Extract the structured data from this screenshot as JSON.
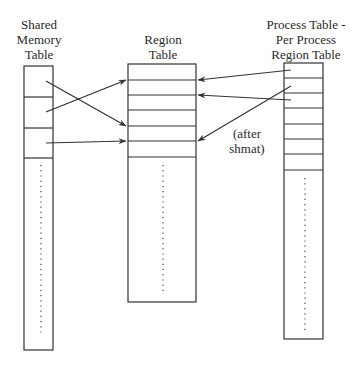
{
  "diagram": {
    "tables": [
      {
        "id": "shared-memory-table",
        "title_lines": [
          "Shared",
          "Memory",
          "Table"
        ],
        "box": {
          "x": 24,
          "y": 66,
          "w": 29,
          "h": 284
        },
        "row_lines": [
          97,
          128,
          158
        ],
        "dots": {
          "x": 41,
          "y1": 165,
          "y2": 335
        }
      },
      {
        "id": "region-table",
        "title_lines": [
          "Region",
          "Table"
        ],
        "box": {
          "x": 128,
          "y": 64,
          "w": 68,
          "h": 238
        },
        "row_lines": [
          80,
          95,
          110,
          126,
          141,
          157
        ],
        "dots": {
          "x": 163,
          "y1": 165,
          "y2": 293
        }
      },
      {
        "id": "process-table",
        "title_lines": [
          "Process Table -",
          "Per Process",
          "Region Table"
        ],
        "box": {
          "x": 284,
          "y": 63,
          "w": 39,
          "h": 276
        },
        "row_lines": [
          78,
          93,
          108,
          124,
          139,
          154,
          170
        ],
        "dots": {
          "x": 305,
          "y1": 178,
          "y2": 330
        }
      }
    ],
    "arrows": [
      {
        "from": "shared-memory-table",
        "to": "region-table",
        "x1": 46,
        "y1": 81,
        "x2": 126,
        "y2": 126
      },
      {
        "from": "shared-memory-table",
        "to": "region-table",
        "x1": 46,
        "y1": 112,
        "x2": 126,
        "y2": 80
      },
      {
        "from": "shared-memory-table",
        "to": "region-table",
        "x1": 46,
        "y1": 143,
        "x2": 126,
        "y2": 141
      },
      {
        "from": "process-table",
        "to": "region-table",
        "x1": 291,
        "y1": 70,
        "x2": 198,
        "y2": 80
      },
      {
        "from": "process-table",
        "to": "region-table",
        "x1": 291,
        "y1": 100,
        "x2": 198,
        "y2": 95
      },
      {
        "from": "process-table",
        "to": "region-table",
        "x1": 291,
        "y1": 86,
        "x2": 198,
        "y2": 141
      }
    ],
    "annotation": {
      "lines": [
        "(after",
        "shmat)"
      ],
      "x": 222,
      "y": 125
    },
    "colors": {
      "line": "#333333",
      "background": "#ffffff"
    }
  }
}
